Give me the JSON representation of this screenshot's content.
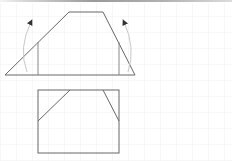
{
  "canvas": {
    "width": 232,
    "height": 161,
    "grid_spacing": 16,
    "grid_color": "#f2f2f2",
    "line_color": "#666666",
    "arrow_color": "#bbbbbb",
    "background": "#ffffff"
  },
  "top_figure": {
    "shape": "trapezoid",
    "points": [
      [
        5,
        75
      ],
      [
        69,
        12
      ],
      [
        103,
        12
      ],
      [
        135,
        75
      ]
    ],
    "verticals": [
      {
        "x": 38,
        "y1": 43,
        "y2": 75
      },
      {
        "x": 119,
        "y1": 43,
        "y2": 75
      }
    ],
    "arrows": [
      {
        "side": "left",
        "from": [
          26,
          72
        ],
        "to": [
          31,
          22
        ]
      },
      {
        "side": "right",
        "from": [
          129,
          72
        ],
        "to": [
          125,
          22
        ]
      }
    ]
  },
  "bottom_figure": {
    "shape": "rectangle-with-folded-corners",
    "rect": {
      "x": 38,
      "y": 90,
      "width": 81,
      "height": 63
    },
    "diagonals": [
      {
        "from": [
          38,
          121
        ],
        "to": [
          70,
          90
        ]
      },
      {
        "from": [
          103,
          90
        ],
        "to": [
          119,
          121
        ]
      }
    ]
  }
}
